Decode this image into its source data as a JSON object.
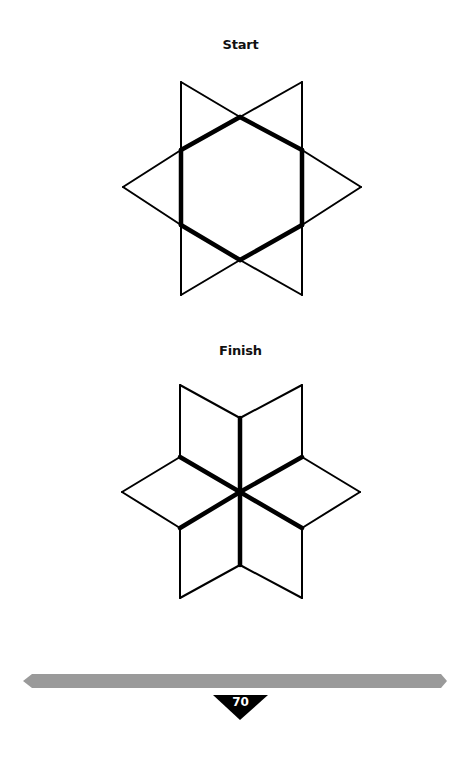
{
  "puzzle": {
    "start": {
      "label": "Start",
      "thin_segments": [
        [
          181,
          82,
          240,
          117
        ],
        [
          302,
          82,
          240,
          117
        ],
        [
          181,
          82,
          181,
          150
        ],
        [
          302,
          82,
          302,
          150
        ],
        [
          181,
          150,
          123,
          187
        ],
        [
          181,
          225,
          123,
          187
        ],
        [
          302,
          150,
          361,
          187
        ],
        [
          302,
          225,
          361,
          187
        ],
        [
          181,
          225,
          181,
          295
        ],
        [
          302,
          225,
          302,
          295
        ],
        [
          181,
          295,
          240,
          260
        ],
        [
          302,
          295,
          240,
          260
        ]
      ],
      "thick_segments": [
        [
          240,
          117,
          181,
          150
        ],
        [
          240,
          117,
          302,
          150
        ],
        [
          181,
          150,
          181,
          225
        ],
        [
          302,
          150,
          302,
          225
        ],
        [
          181,
          225,
          240,
          260
        ],
        [
          302,
          225,
          240,
          260
        ]
      ]
    },
    "finish": {
      "label": "Finish",
      "thin_segments": [
        [
          180,
          385,
          240,
          418
        ],
        [
          302,
          385,
          240,
          418
        ],
        [
          180,
          385,
          180,
          457
        ],
        [
          302,
          385,
          302,
          457
        ],
        [
          180,
          457,
          122,
          492
        ],
        [
          180,
          528,
          122,
          492
        ],
        [
          302,
          457,
          360,
          492
        ],
        [
          302,
          528,
          360,
          492
        ],
        [
          180,
          528,
          180,
          598
        ],
        [
          302,
          528,
          302,
          598
        ],
        [
          180,
          598,
          240,
          565
        ],
        [
          302,
          598,
          240,
          565
        ]
      ],
      "thick_segments": [
        [
          240,
          418,
          240,
          492
        ],
        [
          240,
          492,
          240,
          565
        ],
        [
          180,
          457,
          240,
          492
        ],
        [
          302,
          457,
          240,
          492
        ],
        [
          180,
          528,
          240,
          492
        ],
        [
          302,
          528,
          240,
          492
        ]
      ]
    }
  },
  "footer": {
    "page_number": "70",
    "bar_color": "#9a9a9a",
    "marker_color": "#000000"
  }
}
